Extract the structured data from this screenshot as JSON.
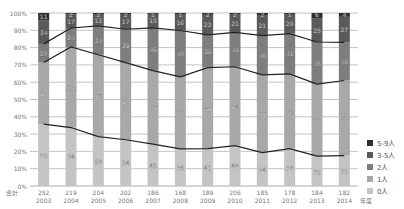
{
  "chart_data": {
    "type": "bar",
    "subtype": "stacked_percent_bar_with_lines",
    "title": "",
    "xlabel": "年度",
    "ylabel": "",
    "ylim": [
      0,
      100
    ],
    "y_ticks": [
      "0%",
      "10%",
      "20%",
      "30%",
      "40%",
      "50%",
      "60%",
      "70%",
      "80%",
      "90%",
      "100%"
    ],
    "total_label": "合計",
    "categories": [
      "2003",
      "2004",
      "2005",
      "2006",
      "2007",
      "2008",
      "2009",
      "2010",
      "2011",
      "2012",
      "2013",
      "2014"
    ],
    "totals": [
      252,
      219,
      204,
      202,
      186,
      168,
      189,
      206,
      185,
      178,
      184,
      182
    ],
    "series": [
      {
        "name": "0人",
        "color": "#c4c4c4",
        "values": [
          90,
          74,
          58,
          54,
          45,
          36,
          41,
          48,
          34,
          38,
          32,
          32
        ]
      },
      {
        "name": "1人",
        "color": "#a8a8a8",
        "values": [
          90,
          102,
          96,
          90,
          79,
          70,
          89,
          94,
          79,
          76,
          77,
          79
        ]
      },
      {
        "name": "2人",
        "color": "#7e7e7e",
        "values": [
          27,
          24,
          34,
          39,
          46,
          45,
          36,
          41,
          40,
          41,
          45,
          40
        ]
      },
      {
        "name": "3-5人",
        "color": "#5a5a5a",
        "values": [
          34,
          17,
          13,
          17,
          15,
          16,
          22,
          21,
          21,
          20,
          25,
          27
        ]
      },
      {
        "name": "5-9人",
        "color": "#2e2e2e",
        "values": [
          11,
          2,
          2,
          2,
          1,
          1,
          2,
          2,
          2,
          1,
          6,
          4
        ]
      }
    ],
    "lines": [
      {
        "name": "0人 cumulative boundary",
        "description": "line at top of 0人 segment"
      },
      {
        "name": "1人 cumulative boundary",
        "description": "line at top of 1人 segment"
      },
      {
        "name": "2人 cumulative boundary",
        "description": "line at top of 2人 segment"
      }
    ],
    "grid": true,
    "legend_position": "right-bottom"
  },
  "legend": {
    "items": [
      {
        "label": "5-9人",
        "color": "#2e2e2e"
      },
      {
        "label": "3-5人",
        "color": "#5a5a5a"
      },
      {
        "label": "2人",
        "color": "#7e7e7e"
      },
      {
        "label": "1人",
        "color": "#a8a8a8"
      },
      {
        "label": "0人",
        "color": "#c4c4c4"
      }
    ]
  }
}
